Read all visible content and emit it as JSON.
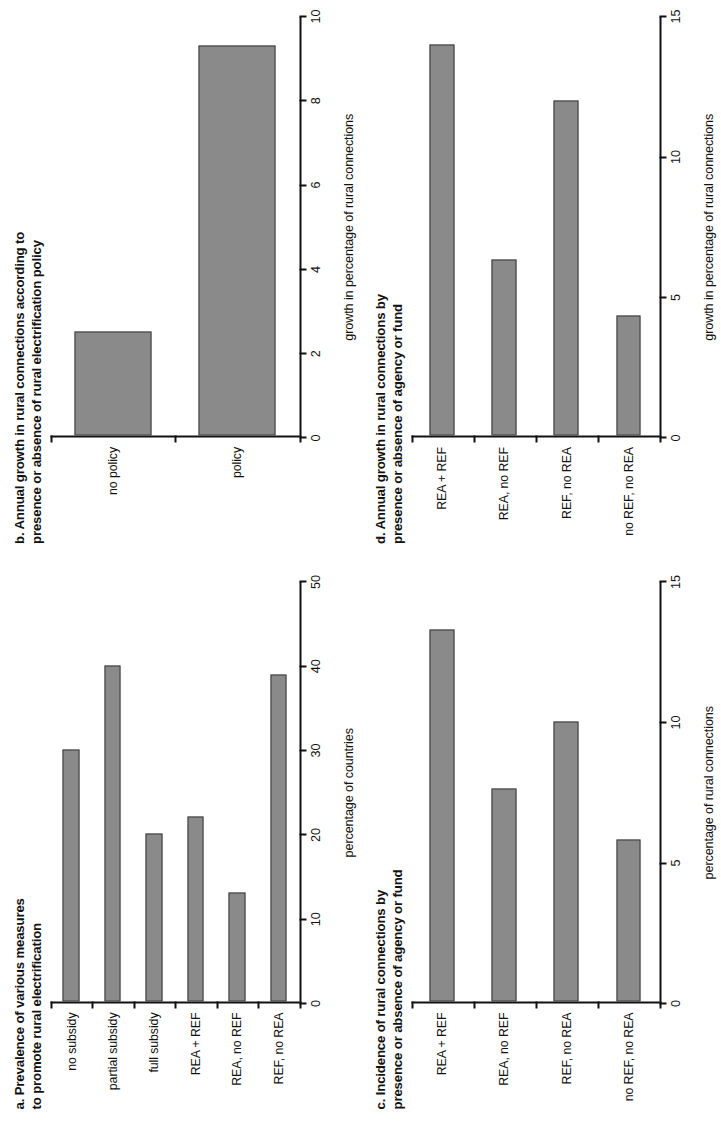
{
  "figure": {
    "orientation": "rotated-90-ccw",
    "bar_fill_color": "#8a8a8a",
    "bar_border_color": "#3b3b3b",
    "axis_color": "#111111",
    "background_color": "#ffffff"
  },
  "chart_data": [
    {
      "id": "panel-a",
      "type": "bar",
      "orientation": "vertical",
      "title": "a. Prevalence of various measures\nto promote rural electrification",
      "panel_letter": "a",
      "categories": [
        "no subsidy",
        "partial subsidy",
        "full subsidy",
        "REA + REF",
        "REA, no REF",
        "REF, no REA"
      ],
      "values": [
        30,
        40,
        20,
        22,
        13,
        39
      ],
      "xlabel": "",
      "ylabel": "percentage of countries",
      "ylim": [
        0,
        50
      ],
      "yticks": [
        0,
        10,
        20,
        30,
        40,
        50
      ],
      "ytick_labels": [
        "0",
        "10",
        "20",
        "30",
        "40",
        "50"
      ],
      "grid": false,
      "legend": false
    },
    {
      "id": "panel-b",
      "type": "bar",
      "orientation": "vertical",
      "title": "b. Annual growth in rural connections according to\npresence or absence of rural electrification policy",
      "panel_letter": "b",
      "categories": [
        "no policy",
        "policy"
      ],
      "values": [
        2.5,
        9.3
      ],
      "xlabel": "",
      "ylabel": "growth in percentage of rural connections",
      "ylim": [
        0,
        10
      ],
      "yticks": [
        0,
        2,
        4,
        6,
        8,
        10
      ],
      "ytick_labels": [
        "0",
        "2",
        "4",
        "6",
        "8",
        "10"
      ],
      "grid": false,
      "legend": false
    },
    {
      "id": "panel-c",
      "type": "bar",
      "orientation": "vertical",
      "title": "c. Incidence of rural connections by\npresence or absence of agency or fund",
      "panel_letter": "c",
      "categories": [
        "REA + REF",
        "REA, no REF",
        "REF, no REA",
        "no REF, no REA"
      ],
      "values": [
        13.3,
        7.6,
        10.0,
        5.8
      ],
      "xlabel": "",
      "ylabel": "percentage of rural connections",
      "ylim": [
        0,
        15
      ],
      "yticks": [
        0,
        5,
        10,
        15
      ],
      "ytick_labels": [
        "0",
        "5",
        "10",
        "15"
      ],
      "grid": false,
      "legend": false
    },
    {
      "id": "panel-d",
      "type": "bar",
      "orientation": "vertical",
      "title": "d. Annual growth in rural connections by\npresence or absence of agency or fund",
      "panel_letter": "d",
      "categories": [
        "REA + REF",
        "REA, no REF",
        "REF, no REA",
        "no REF, no REA"
      ],
      "values": [
        14.0,
        6.3,
        12.0,
        4.3
      ],
      "xlabel": "",
      "ylabel": "growth in percentage of rural connections",
      "ylim": [
        0,
        15
      ],
      "yticks": [
        0,
        5,
        10,
        15
      ],
      "ytick_labels": [
        "0",
        "5",
        "10",
        "15"
      ],
      "grid": false,
      "legend": false
    }
  ]
}
